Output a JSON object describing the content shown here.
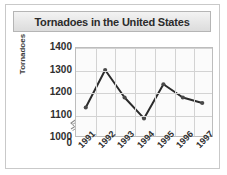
{
  "chart_data": {
    "type": "line",
    "title": "Tornadoes in the United States",
    "xlabel": "",
    "ylabel": "Tornadoes",
    "categories": [
      "1991",
      "1992",
      "1993",
      "1994",
      "1995",
      "1996",
      "1997"
    ],
    "values": [
      1130,
      1300,
      1175,
      1080,
      1235,
      1175,
      1150
    ],
    "series": [
      {
        "name": "Tornadoes",
        "values": [
          1130,
          1300,
          1175,
          1080,
          1235,
          1175,
          1150
        ]
      }
    ],
    "ytick_labels": [
      "1400",
      "1300",
      "1200",
      "1100",
      "1000",
      "0"
    ],
    "ytick_values": [
      1400,
      1300,
      1200,
      1100,
      1000,
      0
    ],
    "ylim": [
      1000,
      1400
    ],
    "axis_break": true,
    "grid": true,
    "legend": "none",
    "line_color": "#2b2b2b",
    "marker_color": "#4a4a4a",
    "grid_color": "#d3d3d3",
    "plot_background": "#fbfbfb"
  },
  "title_bar": {
    "label": "Tornadoes in the United States"
  },
  "axes": {
    "y_title": "Tornadoes"
  }
}
